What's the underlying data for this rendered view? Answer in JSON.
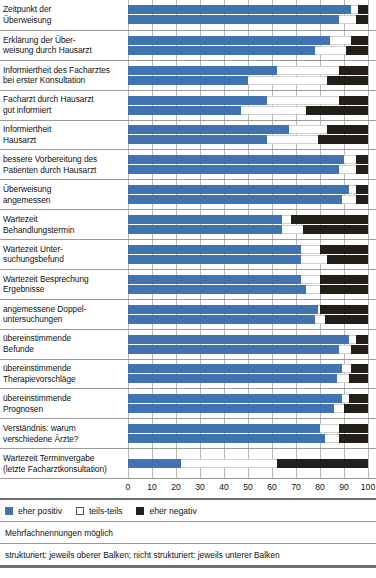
{
  "chart_data": {
    "type": "bar",
    "orientation": "horizontal",
    "stacked": true,
    "title": "",
    "xlabel": "",
    "ylabel": "",
    "xlim": [
      0,
      100
    ],
    "xticks": [
      "0",
      "10",
      "20",
      "30",
      "40",
      "50",
      "60",
      "70",
      "80",
      "90",
      "100"
    ],
    "grid": true,
    "legend_position": "bottom-left",
    "series": [
      {
        "name": "eher positiv",
        "color": "#4173b0"
      },
      {
        "name": "teils-teils",
        "color": "#ffffff"
      },
      {
        "name": "eher negativ",
        "color": "#231f18"
      }
    ],
    "bar_groups": [
      {
        "label_lines": [
          "Zeitpunkt der",
          "Überweisung"
        ],
        "bars": [
          {
            "variant": "strukturiert",
            "values": [
              93,
              3,
              4
            ]
          },
          {
            "variant": "nicht strukturiert",
            "values": [
              88,
              7,
              5
            ]
          }
        ]
      },
      {
        "label_lines": [
          "Erklärung der Über-",
          "weisung durch Hausarzt"
        ],
        "bars": [
          {
            "variant": "strukturiert",
            "values": [
              84,
              9,
              7
            ]
          },
          {
            "variant": "nicht strukturiert",
            "values": [
              78,
              13,
              9
            ]
          }
        ]
      },
      {
        "label_lines": [
          "Informiertheit des Facharztes",
          "bei erster Konsultation"
        ],
        "bars": [
          {
            "variant": "strukturiert",
            "values": [
              62,
              26,
              12
            ]
          },
          {
            "variant": "nicht strukturiert",
            "values": [
              50,
              33,
              17
            ]
          }
        ]
      },
      {
        "label_lines": [
          "Facharzt durch Hausarzt",
          "gut informiert"
        ],
        "bars": [
          {
            "variant": "strukturiert",
            "values": [
              58,
              30,
              12
            ]
          },
          {
            "variant": "nicht strukturiert",
            "values": [
              47,
              27,
              26
            ]
          }
        ]
      },
      {
        "label_lines": [
          "Informiertheit",
          "Hausarzt"
        ],
        "bars": [
          {
            "variant": "strukturiert",
            "values": [
              67,
              16,
              17
            ]
          },
          {
            "variant": "nicht strukturiert",
            "values": [
              58,
              21,
              21
            ]
          }
        ]
      },
      {
        "label_lines": [
          "bessere Vorbereitung des",
          "Patienten durch Hausarzt"
        ],
        "bars": [
          {
            "variant": "strukturiert",
            "values": [
              90,
              5,
              5
            ]
          },
          {
            "variant": "nicht strukturiert",
            "values": [
              88,
              7,
              5
            ]
          }
        ]
      },
      {
        "label_lines": [
          "Überweisung",
          "angemessen"
        ],
        "bars": [
          {
            "variant": "strukturiert",
            "values": [
              92,
              3,
              5
            ]
          },
          {
            "variant": "nicht strukturiert",
            "values": [
              89,
              6,
              5
            ]
          }
        ]
      },
      {
        "label_lines": [
          "Wartezeit",
          "Behandlungstermin"
        ],
        "bars": [
          {
            "variant": "strukturiert",
            "values": [
              64,
              4,
              32
            ]
          },
          {
            "variant": "nicht strukturiert",
            "values": [
              64,
              9,
              27
            ]
          }
        ]
      },
      {
        "label_lines": [
          "Wartezeit Unter-",
          "suchungsbefund"
        ],
        "bars": [
          {
            "variant": "strukturiert",
            "values": [
              72,
              8,
              20
            ]
          },
          {
            "variant": "nicht strukturiert",
            "values": [
              72,
              11,
              17
            ]
          }
        ]
      },
      {
        "label_lines": [
          "Wartezeit Besprechung",
          "Ergebnisse"
        ],
        "bars": [
          {
            "variant": "strukturiert",
            "values": [
              72,
              8,
              20
            ]
          },
          {
            "variant": "nicht strukturiert",
            "values": [
              74,
              6,
              20
            ]
          }
        ]
      },
      {
        "label_lines": [
          "angemessene Doppel-",
          "untersuchungen"
        ],
        "bars": [
          {
            "variant": "strukturiert",
            "values": [
              79,
              1,
              20
            ]
          },
          {
            "variant": "nicht strukturiert",
            "values": [
              78,
              4,
              18
            ]
          }
        ]
      },
      {
        "label_lines": [
          "übereinstimmende",
          "Befunde"
        ],
        "bars": [
          {
            "variant": "strukturiert",
            "values": [
              92,
              3,
              5
            ]
          },
          {
            "variant": "nicht strukturiert",
            "values": [
              88,
              5,
              7
            ]
          }
        ]
      },
      {
        "label_lines": [
          "übereinstimmende",
          "Therapievorschläge"
        ],
        "bars": [
          {
            "variant": "strukturiert",
            "values": [
              89,
              4,
              7
            ]
          },
          {
            "variant": "nicht strukturiert",
            "values": [
              87,
              5,
              8
            ]
          }
        ]
      },
      {
        "label_lines": [
          "übereinstimmende",
          "Prognosen"
        ],
        "bars": [
          {
            "variant": "strukturiert",
            "values": [
              89,
              3,
              8
            ]
          },
          {
            "variant": "nicht strukturiert",
            "values": [
              86,
              4,
              10
            ]
          }
        ]
      },
      {
        "label_lines": [
          "Verständnis: warum",
          "verschiedene Ärzte?"
        ],
        "bars": [
          {
            "variant": "strukturiert",
            "values": [
              80,
              8,
              12
            ]
          },
          {
            "variant": "nicht strukturiert",
            "values": [
              82,
              6,
              12
            ]
          }
        ]
      },
      {
        "label_lines": [
          "Wartezeit Terminvergabe",
          "(letzte Facharztkonsultation)"
        ],
        "bars": [
          {
            "variant": "single",
            "values": [
              22,
              40,
              38
            ]
          }
        ]
      }
    ]
  },
  "legend": {
    "items": [
      {
        "key": "pos",
        "label": "eher positiv"
      },
      {
        "key": "mid",
        "label": "teils-teils"
      },
      {
        "key": "neg",
        "label": "eher negativ"
      }
    ]
  },
  "footnotes": {
    "note1": "Mehrfachnennungen möglich",
    "note2": "strukturiert: jeweils oberer Balken; nicht strukturiert: jeweils unterer Balken"
  }
}
